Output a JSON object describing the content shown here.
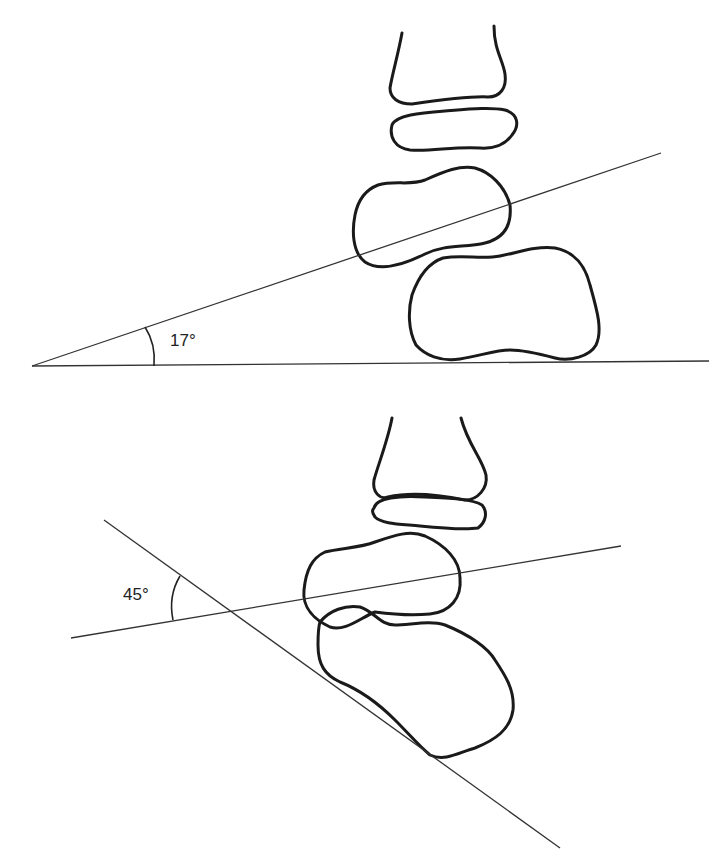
{
  "figure": {
    "top_panel": {
      "angle_label": "17°",
      "angle_value": 17,
      "description": "Lateral view of stacked bones with a reference line tangent to the base at 17° from horizontal"
    },
    "bottom_panel": {
      "angle_label": "45°",
      "angle_value": 45,
      "description": "Oblique view with two reference lines intersecting at 45°"
    },
    "colors": {
      "stroke": "#1a1a1a",
      "line": "#333333",
      "background": "#ffffff"
    }
  }
}
